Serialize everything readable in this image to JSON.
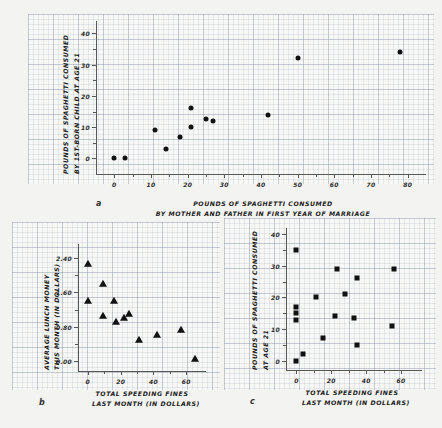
{
  "figure": {
    "background_color": "#f3f3f1",
    "marker_color": "#111111",
    "axis_color": "#585858",
    "grid_color": "#8892a6"
  },
  "chart_data": [
    {
      "type": "scatter",
      "panel_letter": "a",
      "title": "",
      "xlabel": "POUNDS OF SPAGHETTI CONSUMED\nBY MOTHER AND FATHER IN FIRST YEAR OF MARRIAGE",
      "xlabel_line1": "POUNDS OF SPAGHETTI CONSUMED",
      "xlabel_line2": "BY MOTHER AND FATHER IN FIRST YEAR OF MARRIAGE",
      "ylabel": "POUNDS OF SPAGHETTI CONSUMED BY 1ST-BORN CHILD AT AGE 21",
      "ylabel_line1": "POUNDS OF SPAGHETTI CONSUMED",
      "ylabel_line2": "BY 1ST-BORN CHILD AT AGE 21",
      "marker": "circle",
      "xlim": [
        -5,
        85
      ],
      "ylim": [
        -5,
        44
      ],
      "xticks": [
        0,
        10,
        20,
        30,
        40,
        50,
        60,
        70,
        80
      ],
      "xticklabels": [
        "0",
        "10",
        "20",
        "30",
        "40",
        "50",
        "60",
        "70",
        "80"
      ],
      "yticks": [
        0,
        10,
        20,
        30,
        40
      ],
      "yticklabels": [
        "0",
        "10",
        "20",
        "30",
        "40"
      ],
      "grid": true,
      "legend": "none",
      "points": [
        {
          "x": 0,
          "y": 0
        },
        {
          "x": 3,
          "y": 0
        },
        {
          "x": 11,
          "y": 9
        },
        {
          "x": 14,
          "y": 3
        },
        {
          "x": 18,
          "y": 7
        },
        {
          "x": 21,
          "y": 10
        },
        {
          "x": 21,
          "y": 16
        },
        {
          "x": 25,
          "y": 12.5
        },
        {
          "x": 27,
          "y": 12
        },
        {
          "x": 42,
          "y": 14
        },
        {
          "x": 50,
          "y": 32
        },
        {
          "x": 78,
          "y": 34
        }
      ]
    },
    {
      "type": "scatter",
      "panel_letter": "b",
      "title": "",
      "xlabel": "TOTAL SPEEDING FINES LAST MONTH (IN DOLLARS)",
      "xlabel_line1": "TOTAL SPEEDING FINES",
      "xlabel_line2": "LAST MONTH (IN DOLLARS)",
      "ylabel": "AVERAGE LUNCH MONEY THIS MONTH (IN DOLLARS)",
      "ylabel_line1": "AVERAGE LUNCH MONEY",
      "ylabel_line2": "THIS MONTH (IN DOLLARS)",
      "marker": "triangle",
      "xlim": [
        -6,
        72
      ],
      "ylim": [
        -0.22,
        2.72
      ],
      "xticks": [
        0,
        20,
        40,
        60
      ],
      "xticklabels": [
        "0",
        "20",
        "40",
        "60"
      ],
      "yticks": [
        0.0,
        0.8,
        1.6,
        2.4
      ],
      "yticklabels": [
        "0.00",
        "0.80",
        "1.60",
        "2.40"
      ],
      "grid": true,
      "legend": "none",
      "points": [
        {
          "x": 0,
          "y": 2.25
        },
        {
          "x": 0,
          "y": 1.4
        },
        {
          "x": 9,
          "y": 1.8
        },
        {
          "x": 9,
          "y": 1.05
        },
        {
          "x": 16,
          "y": 1.4
        },
        {
          "x": 17,
          "y": 0.92
        },
        {
          "x": 22,
          "y": 1.0
        },
        {
          "x": 25,
          "y": 1.1
        },
        {
          "x": 31,
          "y": 0.5
        },
        {
          "x": 42,
          "y": 0.62
        },
        {
          "x": 57,
          "y": 0.72
        },
        {
          "x": 65,
          "y": 0.05
        }
      ]
    },
    {
      "type": "scatter",
      "panel_letter": "c",
      "title": "",
      "xlabel": "TOTAL SPEEDING FINES LAST MONTH (IN DOLLARS)",
      "xlabel_line1": "TOTAL SPEEDING FINES",
      "xlabel_line2": "LAST MONTH (IN DOLLARS)",
      "ylabel": "POUNDS OF SPAGHETTI CONSUMED AT AGE 21",
      "ylabel_line1": "POUNDS OF SPAGHETTI CONSUMED",
      "ylabel_line2": "AT AGE 21",
      "marker": "square",
      "xlim": [
        -6,
        72
      ],
      "ylim": [
        -3,
        42
      ],
      "xticks": [
        0,
        20,
        40,
        60
      ],
      "xticklabels": [
        "0",
        "20",
        "40",
        "60"
      ],
      "yticks": [
        0,
        10,
        20,
        30,
        40
      ],
      "yticklabels": [
        "0",
        "10",
        "20",
        "30",
        "40"
      ],
      "grid": true,
      "legend": "none",
      "points": [
        {
          "x": 0,
          "y": 0
        },
        {
          "x": 0,
          "y": 13
        },
        {
          "x": 0,
          "y": 15
        },
        {
          "x": 0,
          "y": 17
        },
        {
          "x": 0,
          "y": 35
        },
        {
          "x": 4,
          "y": 2
        },
        {
          "x": 11,
          "y": 20
        },
        {
          "x": 15,
          "y": 7
        },
        {
          "x": 22,
          "y": 14
        },
        {
          "x": 23,
          "y": 29
        },
        {
          "x": 28,
          "y": 21
        },
        {
          "x": 33,
          "y": 13.5
        },
        {
          "x": 35,
          "y": 26
        },
        {
          "x": 35,
          "y": 5
        },
        {
          "x": 55,
          "y": 11
        },
        {
          "x": 56,
          "y": 29
        }
      ]
    }
  ]
}
